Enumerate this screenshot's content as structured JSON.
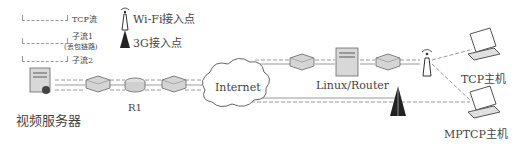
{
  "legend": {
    "items": [
      {
        "label": "TCP流"
      },
      {
        "label": "子流1"
      },
      {
        "label": "(丢包链路)"
      },
      {
        "label": "子流2"
      }
    ],
    "wifi_label": "Wi-Fi接入点",
    "cell_label": "3G接入点"
  },
  "nodes": {
    "video_server": "视频服务器",
    "r1": "R1",
    "internet": "Internet",
    "linux_router": "Linux/Router",
    "tcp_host": "TCP主机",
    "mptcp_host": "MPTCP主机"
  },
  "colors": {
    "line": "#9a9a9a",
    "device": "#d8d8d8",
    "device_dark": "#555555",
    "text": "#333333"
  }
}
